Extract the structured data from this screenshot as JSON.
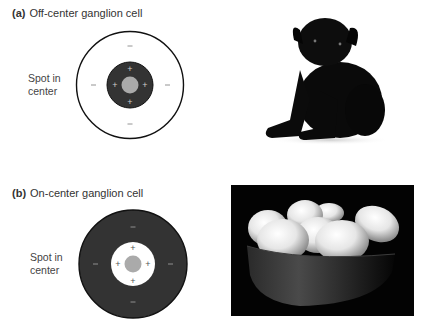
{
  "panels": [
    {
      "letter": "(a)",
      "title": "Off-center ganglion cell",
      "stimulus_label_line1": "Spot in",
      "stimulus_label_line2": "center",
      "center_sign": "+",
      "surround_sign": "–",
      "center_color": "#333333",
      "surround_color": "#ffffff",
      "spot_color": "#aaaaaa",
      "photo": "black-pug-puppy-on-white-background"
    },
    {
      "letter": "(b)",
      "title": "On-center ganglion cell",
      "stimulus_label_line1": "Spot in",
      "stimulus_label_line2": "center",
      "center_sign": "+",
      "surround_sign": "–",
      "center_color": "#ffffff",
      "surround_color": "#333333",
      "spot_color": "#aaaaaa",
      "photo": "white-eggs-in-bowl-on-black-background"
    }
  ]
}
